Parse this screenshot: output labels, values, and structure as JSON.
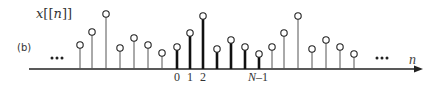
{
  "figure": {
    "panel_label": "(b)",
    "title_var": "x",
    "title_open": "[[",
    "title_arg": "n",
    "title_close": "]]",
    "axis_label": "n",
    "ellipsis_left": "•••",
    "ellipsis_right": "•••",
    "tick_labels": [
      {
        "text": "0",
        "x": 177
      },
      {
        "text": "1",
        "x": 190
      },
      {
        "text": "2",
        "x": 203
      },
      {
        "text": "N–1",
        "x": 258,
        "italic_prefix": true
      }
    ],
    "colors": {
      "stem": "#555555",
      "stem_bold": "#111111",
      "axis": "#222222",
      "marker_fill": "#ffffff"
    }
  },
  "chart_data": {
    "type": "stem",
    "title": "x[[n]]",
    "xlabel": "n",
    "period_N": 7,
    "base_period_values": [
      22,
      36,
      53,
      20,
      29,
      22,
      15
    ],
    "periods": [
      {
        "name": "previous period",
        "bold": false,
        "x": [
          80,
          92,
          106,
          120,
          134,
          148,
          162
        ],
        "values": [
          24,
          37,
          55,
          21,
          31,
          24,
          16
        ]
      },
      {
        "name": "base period n=0..N-1",
        "bold": true,
        "x": [
          177,
          190,
          203,
          217,
          231,
          245,
          259
        ],
        "values": [
          22,
          36,
          53,
          20,
          29,
          22,
          15
        ]
      },
      {
        "name": "next period",
        "bold": false,
        "x": [
          272,
          284,
          298,
          312,
          326,
          340,
          354
        ],
        "values": [
          22,
          36,
          53,
          20,
          29,
          22,
          15
        ]
      }
    ],
    "baseline_y": 69,
    "x_ticks": [
      "0",
      "1",
      "2",
      "N–1"
    ]
  }
}
